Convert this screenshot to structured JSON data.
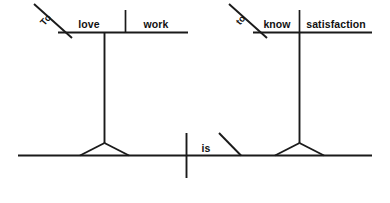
{
  "diagram": {
    "type": "reed-kellogg-sentence-diagram",
    "sentence": "To love work is to know satisfaction.",
    "ink_color": "#1a1a1a",
    "background_color": "#ffffff",
    "subject_clause": {
      "name": "subject-infinitive-phrase",
      "preposition_marker": "To",
      "verb": "love",
      "object": "work"
    },
    "predicate": {
      "name": "linking-verb",
      "verb": "is"
    },
    "complement_clause": {
      "name": "complement-infinitive-phrase",
      "preposition_marker": "to",
      "verb": "know",
      "object": "satisfaction"
    },
    "labels": {
      "to_left": "To",
      "love": "love",
      "work": "work",
      "is": "is",
      "to_right": "to",
      "know": "know",
      "satisfaction": "satisfaction"
    }
  }
}
